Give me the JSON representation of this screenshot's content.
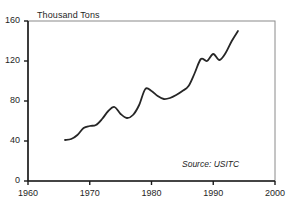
{
  "chart_data": {
    "type": "line",
    "title": "",
    "subtitle": "",
    "xlabel": "",
    "ylabel": "Thousand Tons",
    "xlim": [
      1960,
      2000
    ],
    "ylim": [
      0,
      160
    ],
    "xticks": [
      "1960",
      "1970",
      "1980",
      "1990",
      "2000"
    ],
    "xtick_values": [
      1960,
      1970,
      1980,
      1990,
      2000
    ],
    "yticks": [
      "0",
      "40",
      "80",
      "120",
      "160"
    ],
    "ytick_values": [
      0,
      40,
      80,
      120,
      160
    ],
    "grid": false,
    "legend": "none",
    "annotations": [
      {
        "text": "Source:  USITC",
        "position": "bottom-right",
        "style": "italic"
      }
    ],
    "line_color": "#262626",
    "line_width": 1.8,
    "series": [
      {
        "name": "Thousand Tons",
        "x": [
          1966,
          1967,
          1968,
          1969,
          1970,
          1971,
          1972,
          1973,
          1974,
          1975,
          1976,
          1977,
          1978,
          1979,
          1980,
          1981,
          1982,
          1983,
          1984,
          1985,
          1986,
          1987,
          1988,
          1989,
          1990,
          1991,
          1992,
          1993,
          1994
        ],
        "values": [
          41,
          42,
          46,
          53,
          55,
          56,
          62,
          70,
          74,
          67,
          63,
          66,
          76,
          92,
          90,
          85,
          82,
          83,
          86,
          90,
          95,
          108,
          122,
          120,
          127,
          121,
          128,
          140,
          150
        ]
      }
    ]
  },
  "axes_geometry": {
    "plot_left_px": 28,
    "plot_right_px": 275,
    "plot_top_px": 21,
    "plot_bottom_px": 181
  },
  "labels": {
    "ylabel": "Thousand Tons",
    "source": "Source:  USITC"
  }
}
